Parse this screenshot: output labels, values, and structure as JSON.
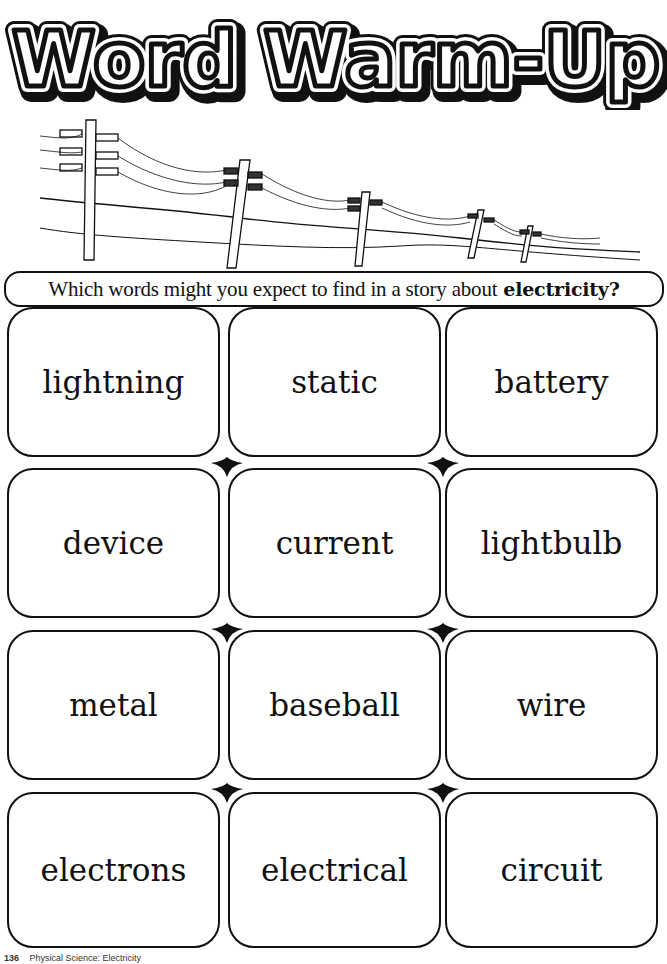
{
  "title": "Word Warm-Up",
  "illustration": {
    "subject": "telephone-poles-with-power-lines",
    "pole_count": 5
  },
  "prompt": {
    "text": "Which words might you expect to find in a story about",
    "emphasis": "electricity?"
  },
  "words": [
    [
      "lightning",
      "static",
      "battery"
    ],
    [
      "device",
      "current",
      "lightbulb"
    ],
    [
      "metal",
      "baseball",
      "wire"
    ],
    [
      "electrons",
      "electrical",
      "circuit"
    ]
  ],
  "footer": {
    "page": "136",
    "text": "Physical Science: Electricity"
  },
  "colors": {
    "ink": "#111111",
    "paper": "#ffffff"
  }
}
